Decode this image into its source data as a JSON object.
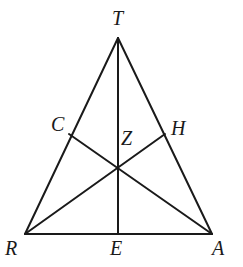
{
  "figure": {
    "kind": "geometry-diagram",
    "width": 243,
    "height": 267,
    "background_color": "#ffffff",
    "stroke_color": "#1a1a1a",
    "label_color": "#1a1a1a",
    "stroke_width": 2
  },
  "points": [
    {
      "id": "T",
      "label": "T",
      "x": 118,
      "y": 38,
      "label_x": 112,
      "label_y": 8,
      "role": "apex-vertex"
    },
    {
      "id": "R",
      "label": "R",
      "x": 25,
      "y": 234,
      "label_x": 5,
      "label_y": 238,
      "role": "bottom-left-vertex"
    },
    {
      "id": "A",
      "label": "A",
      "x": 212,
      "y": 234,
      "label_x": 212,
      "label_y": 238,
      "role": "bottom-right-vertex"
    },
    {
      "id": "C",
      "label": "C",
      "x": 69,
      "y": 134,
      "label_x": 51,
      "label_y": 114,
      "role": "midpoint-of-RT"
    },
    {
      "id": "H",
      "label": "H",
      "x": 165,
      "y": 134,
      "label_x": 171,
      "label_y": 118,
      "role": "midpoint-of-TA"
    },
    {
      "id": "E",
      "label": "E",
      "x": 118,
      "y": 234,
      "label_x": 110,
      "label_y": 238,
      "role": "midpoint-of-RA"
    },
    {
      "id": "Z",
      "label": "Z",
      "x": 118,
      "y": 171,
      "label_x": 121,
      "label_y": 128,
      "role": "centroid"
    }
  ],
  "segments": [
    {
      "id": "side-RT",
      "from": "R",
      "to": "T",
      "kind": "triangle-side"
    },
    {
      "id": "side-TA",
      "from": "T",
      "to": "A",
      "kind": "triangle-side"
    },
    {
      "id": "side-RA",
      "from": "R",
      "to": "A",
      "kind": "triangle-base"
    },
    {
      "id": "median-TE",
      "from": "T",
      "to": "E",
      "kind": "median"
    },
    {
      "id": "median-RH",
      "from": "R",
      "to": "H",
      "kind": "median"
    },
    {
      "id": "median-AC",
      "from": "A",
      "to": "C",
      "kind": "median"
    }
  ]
}
